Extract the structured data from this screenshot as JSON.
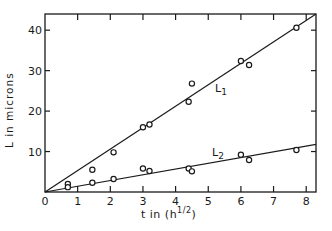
{
  "chart_data": {
    "type": "scatter",
    "title": "",
    "xlabel": "t  in  (h",
    "xlabel_superscript": "1/2",
    "xlabel_suffix": ")",
    "ylabel": "L  in  microns",
    "xlim": [
      0,
      8.3
    ],
    "ylim": [
      0,
      44
    ],
    "x_ticks": [
      0,
      1,
      2,
      3,
      4,
      5,
      6,
      7,
      8
    ],
    "y_ticks": [
      0,
      10,
      20,
      30,
      40
    ],
    "x_tick_labels": [
      "0",
      "1",
      "2",
      "3",
      "4",
      "5",
      "6",
      "7",
      "8"
    ],
    "y_tick_labels": [
      "",
      "10",
      "20",
      "30",
      "40"
    ],
    "grid": false,
    "legend": "inline line labels",
    "series": [
      {
        "name": "L1",
        "label_main": "L",
        "label_sub": "1",
        "marker": "open-circle",
        "fit_line": {
          "slope": 5.3,
          "intercept": 0
        },
        "points": [
          {
            "x": 0.7,
            "y": 2.0
          },
          {
            "x": 1.45,
            "y": 5.5
          },
          {
            "x": 2.1,
            "y": 9.8
          },
          {
            "x": 3.0,
            "y": 16.0
          },
          {
            "x": 3.2,
            "y": 16.7
          },
          {
            "x": 4.4,
            "y": 22.3
          },
          {
            "x": 4.5,
            "y": 26.8
          },
          {
            "x": 6.0,
            "y": 32.4
          },
          {
            "x": 6.25,
            "y": 31.4
          },
          {
            "x": 7.7,
            "y": 40.6
          }
        ]
      },
      {
        "name": "L2",
        "label_main": "L",
        "label_sub": "2",
        "marker": "open-circle",
        "fit_line": {
          "slope": 1.42,
          "intercept": 0
        },
        "points": [
          {
            "x": 0.7,
            "y": 1.2
          },
          {
            "x": 1.45,
            "y": 2.3
          },
          {
            "x": 2.1,
            "y": 3.2
          },
          {
            "x": 3.0,
            "y": 5.8
          },
          {
            "x": 3.2,
            "y": 5.2
          },
          {
            "x": 4.4,
            "y": 5.8
          },
          {
            "x": 4.5,
            "y": 5.1
          },
          {
            "x": 6.0,
            "y": 9.2
          },
          {
            "x": 6.25,
            "y": 7.9
          },
          {
            "x": 7.7,
            "y": 10.4
          }
        ]
      }
    ]
  },
  "colors": {
    "ink": "#1a1a1a",
    "background": "#ffffff"
  }
}
